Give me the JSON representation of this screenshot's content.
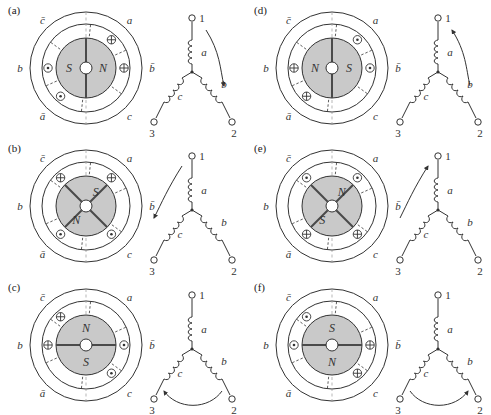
{
  "figure": {
    "type": "three-phase-machine-winding-diagrams",
    "panel_count": 6,
    "colors": {
      "rotor_fill": "#c9c9c9",
      "stator_fill": "#ffffff",
      "line": "#333333",
      "hub_fill": "#ffffff",
      "divider": "#555555"
    },
    "phase_labels": [
      "a",
      "b",
      "c"
    ],
    "terminal_labels": [
      "1",
      "2",
      "3"
    ],
    "coil_labels": [
      "a",
      "b",
      "c"
    ],
    "symbols": {
      "into_page": "⊕",
      "out_of_page": "⊙",
      "north": "N",
      "south": "S"
    }
  },
  "panels": [
    {
      "id": "a",
      "label": "(a)",
      "stator_labels": {
        "top_left": "c̄",
        "top_right": "a",
        "left": "b",
        "right": "b̄",
        "bottom_left": "ā",
        "bottom_right": "c"
      },
      "rotor": {
        "pole_left": "S",
        "pole_right": "N",
        "divider_angle_deg": 90,
        "orientation": "horizontal"
      },
      "slot_currents": [
        {
          "slot": "top-right",
          "phase": "a",
          "symbol": "⊕"
        },
        {
          "slot": "right",
          "phase": "b̄",
          "symbol": "⊕"
        },
        {
          "slot": "left",
          "phase": "b",
          "symbol": "⊙"
        },
        {
          "slot": "bottom-left",
          "phase": "ā",
          "symbol": "⊙"
        }
      ],
      "circuit": {
        "terminals": [
          "1",
          "2",
          "3"
        ],
        "coils": [
          "a",
          "b",
          "c"
        ],
        "current_arrow": {
          "path": "terminal-1-to-coil-b",
          "style": "curve-down-right",
          "direction": "down"
        }
      }
    },
    {
      "id": "b",
      "label": "(b)",
      "stator_labels": {
        "top_left": "c̄",
        "top_right": "a",
        "left": "b",
        "right": "b̄",
        "bottom_left": "ā",
        "bottom_right": "c"
      },
      "rotor": {
        "pole_left": "S",
        "pole_right": "N",
        "divider_angle_deg": 135,
        "orientation": "diagonal-ne-sw"
      },
      "slot_currents": [
        {
          "slot": "top-left",
          "phase": "c̄",
          "symbol": "⊕"
        },
        {
          "slot": "top-right",
          "phase": "a",
          "symbol": "⊕"
        },
        {
          "slot": "bottom-left",
          "phase": "ā",
          "symbol": "⊙"
        },
        {
          "slot": "bottom-right",
          "phase": "c",
          "symbol": "⊙"
        }
      ],
      "circuit": {
        "terminals": [
          "1",
          "2",
          "3"
        ],
        "coils": [
          "a",
          "b",
          "c"
        ],
        "current_arrow": {
          "path": "terminal-1-to-coil-c",
          "style": "curve-down-left",
          "direction": "left"
        }
      }
    },
    {
      "id": "c",
      "label": "(c)",
      "stator_labels": {
        "top_left": "c̄",
        "top_right": "a",
        "left": "b",
        "right": "b̄",
        "bottom_left": "ā",
        "bottom_right": "c"
      },
      "rotor": {
        "pole_left": "N",
        "pole_right": "S",
        "divider_angle_deg": 0,
        "orientation": "vertical"
      },
      "slot_currents": [
        {
          "slot": "top-left",
          "phase": "c̄",
          "symbol": "⊕"
        },
        {
          "slot": "left",
          "phase": "b",
          "symbol": "⊕"
        },
        {
          "slot": "right",
          "phase": "b̄",
          "symbol": "⊙"
        },
        {
          "slot": "bottom-right",
          "phase": "c",
          "symbol": "⊙"
        }
      ],
      "circuit": {
        "terminals": [
          "1",
          "2",
          "3"
        ],
        "coils": [
          "a",
          "b",
          "c"
        ],
        "current_arrow": {
          "path": "terminal-2-to-terminal-3",
          "style": "arc-below",
          "direction": "left"
        }
      }
    },
    {
      "id": "d",
      "label": "(d)",
      "stator_labels": {
        "top_left": "c̄",
        "top_right": "a",
        "left": "b",
        "right": "b̄",
        "bottom_left": "ā",
        "bottom_right": "c"
      },
      "rotor": {
        "pole_left": "N",
        "pole_right": "S",
        "divider_angle_deg": 90,
        "orientation": "horizontal"
      },
      "slot_currents": [
        {
          "slot": "top-right",
          "phase": "a",
          "symbol": "⊙"
        },
        {
          "slot": "right",
          "phase": "b̄",
          "symbol": "⊙"
        },
        {
          "slot": "left",
          "phase": "b",
          "symbol": "⊕"
        },
        {
          "slot": "bottom-left",
          "phase": "ā",
          "symbol": "⊕"
        }
      ],
      "circuit": {
        "terminals": [
          "1",
          "2",
          "3"
        ],
        "coils": [
          "a",
          "b",
          "c"
        ],
        "current_arrow": {
          "path": "coil-b-to-terminal-1",
          "style": "curve-up-right",
          "direction": "up"
        }
      }
    },
    {
      "id": "e",
      "label": "(e)",
      "stator_labels": {
        "top_left": "c̄",
        "top_right": "a",
        "left": "b",
        "right": "b̄",
        "bottom_left": "ā",
        "bottom_right": "c"
      },
      "rotor": {
        "pole_left": "N",
        "pole_right": "S",
        "divider_angle_deg": 135,
        "orientation": "diagonal-ne-sw"
      },
      "slot_currents": [
        {
          "slot": "top-left",
          "phase": "c̄",
          "symbol": "⊙"
        },
        {
          "slot": "top-right",
          "phase": "a",
          "symbol": "⊙"
        },
        {
          "slot": "bottom-left",
          "phase": "ā",
          "symbol": "⊕"
        },
        {
          "slot": "bottom-right",
          "phase": "c",
          "symbol": "⊕"
        }
      ],
      "circuit": {
        "terminals": [
          "1",
          "2",
          "3"
        ],
        "coils": [
          "a",
          "b",
          "c"
        ],
        "current_arrow": {
          "path": "coil-c-to-terminal-1",
          "style": "curve-up-left",
          "direction": "up"
        }
      }
    },
    {
      "id": "f",
      "label": "(f)",
      "stator_labels": {
        "top_left": "c̄",
        "top_right": "a",
        "left": "b",
        "right": "b̄",
        "bottom_left": "ā",
        "bottom_right": "c"
      },
      "rotor": {
        "pole_left": "S",
        "pole_right": "N",
        "divider_angle_deg": 0,
        "orientation": "vertical"
      },
      "slot_currents": [
        {
          "slot": "top-left",
          "phase": "c̄",
          "symbol": "⊙"
        },
        {
          "slot": "left",
          "phase": "b",
          "symbol": "⊙"
        },
        {
          "slot": "right",
          "phase": "b̄",
          "symbol": "⊕"
        },
        {
          "slot": "bottom-right",
          "phase": "c",
          "symbol": "⊕"
        }
      ],
      "circuit": {
        "terminals": [
          "1",
          "2",
          "3"
        ],
        "coils": [
          "a",
          "b",
          "c"
        ],
        "current_arrow": {
          "path": "terminal-3-to-terminal-2",
          "style": "arc-below",
          "direction": "right"
        }
      }
    }
  ]
}
